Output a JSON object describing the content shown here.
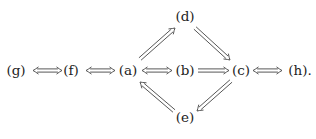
{
  "diagram": {
    "type": "implication-diagram",
    "nodes": [
      {
        "id": "g",
        "label": "(g)"
      },
      {
        "id": "f",
        "label": "(f)"
      },
      {
        "id": "a",
        "label": "(a)"
      },
      {
        "id": "b",
        "label": "(b)"
      },
      {
        "id": "c",
        "label": "(c)"
      },
      {
        "id": "h",
        "label": "(h)."
      },
      {
        "id": "d",
        "label": "(d)"
      },
      {
        "id": "e",
        "label": "(e)"
      }
    ],
    "edges": [
      {
        "from": "g",
        "to": "f",
        "kind": "double-bidirectional",
        "symbol": "⟺"
      },
      {
        "from": "f",
        "to": "a",
        "kind": "double-bidirectional",
        "symbol": "⟺"
      },
      {
        "from": "a",
        "to": "b",
        "kind": "double-bidirectional",
        "symbol": "⟺"
      },
      {
        "from": "b",
        "to": "c",
        "kind": "double-implies",
        "symbol": "⟹"
      },
      {
        "from": "c",
        "to": "h",
        "kind": "double-bidirectional",
        "symbol": "⟺"
      },
      {
        "from": "a",
        "to": "d",
        "kind": "double-implies",
        "symbol": "⟹"
      },
      {
        "from": "d",
        "to": "c",
        "kind": "double-implies",
        "symbol": "⟹"
      },
      {
        "from": "c",
        "to": "e",
        "kind": "double-implies",
        "symbol": "⟹"
      },
      {
        "from": "e",
        "to": "a",
        "kind": "double-implies",
        "symbol": "⟹"
      }
    ]
  }
}
